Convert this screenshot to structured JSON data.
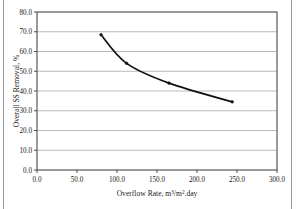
{
  "chart_data": {
    "type": "line",
    "title": "",
    "xlabel": "Overflow Rate, m3/m2.day",
    "xlabel_parts": {
      "lead": "Overflow Rate, m",
      "sup1": "3",
      "mid": "/m",
      "sup2": "2",
      "tail": ".day"
    },
    "ylabel": "Overall SS Removal, %",
    "xlim": [
      0.0,
      300.0
    ],
    "ylim": [
      0.0,
      80.0
    ],
    "xticks": [
      "0.0",
      "50.0",
      "100.0",
      "150.0",
      "200.0",
      "250.0",
      "300.0"
    ],
    "xtick_values": [
      0.0,
      50.0,
      100.0,
      150.0,
      200.0,
      250.0,
      300.0
    ],
    "yticks": [
      "0.0",
      "10.0",
      "20.0",
      "30.0",
      "40.0",
      "50.0",
      "60.0",
      "70.0",
      "80.0"
    ],
    "ytick_values": [
      0.0,
      10.0,
      20.0,
      30.0,
      40.0,
      50.0,
      60.0,
      70.0,
      80.0
    ],
    "grid": "horizontal",
    "legend": "none",
    "x": [
      80.0,
      112.0,
      165.0,
      244.0
    ],
    "values": [
      68.5,
      54.0,
      44.0,
      34.5
    ],
    "series": [
      {
        "name": "Overall SS Removal",
        "x": [
          80.0,
          112.0,
          165.0,
          244.0
        ],
        "values": [
          68.5,
          54.0,
          44.0,
          34.5
        ],
        "color": "#101010",
        "marker": "dot",
        "line_style": "smooth"
      }
    ],
    "colors": {
      "line": "#101010",
      "grid": "#9b9b9b",
      "frame": "#4a4a4a",
      "text": "#1a1a1a",
      "background": "#ffffff"
    }
  }
}
